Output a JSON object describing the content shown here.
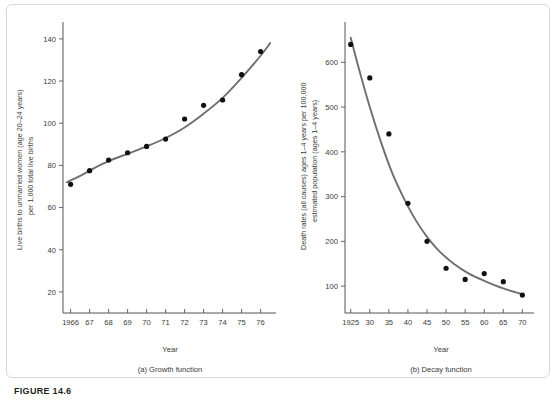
{
  "figure": {
    "number_label": "FIGURE 14.6",
    "border_color": "#d8d8d8",
    "curve_color": "#6f6f6f",
    "point_color": "#111111",
    "axis_color": "#555555"
  },
  "chart_data": [
    {
      "type": "scatter",
      "panel_id": "a",
      "caption": "(a) Growth function",
      "title": "",
      "xlabel": "Year",
      "ylabel": "Live births to unmarried women (age 20–24 years) per 1,000 total live births",
      "ylabel_line1": "Live births to unmarried women (age 20–24 years)",
      "ylabel_line2": "per 1,000 total live births",
      "xtick_labels": [
        "1966",
        "67",
        "68",
        "69",
        "70",
        "71",
        "72",
        "73",
        "74",
        "75",
        "76"
      ],
      "xtick_values": [
        1966,
        1967,
        1968,
        1969,
        1970,
        1971,
        1972,
        1973,
        1974,
        1975,
        1976
      ],
      "ytick_labels": [
        "20",
        "40",
        "60",
        "80",
        "100",
        "120",
        "140"
      ],
      "ytick_values": [
        20,
        40,
        60,
        80,
        100,
        120,
        140
      ],
      "xlim": [
        1965.6,
        1976.6
      ],
      "ylim": [
        10,
        148
      ],
      "grid": false,
      "legend": "none",
      "x": [
        1966,
        1967,
        1968,
        1969,
        1970,
        1971,
        1972,
        1973,
        1974,
        1975,
        1976
      ],
      "values": [
        71,
        77.5,
        82.5,
        86,
        89,
        92.5,
        102,
        108.5,
        111,
        123,
        134
      ],
      "fit_curve": {
        "name": "growth function",
        "x": [
          1965.8,
          1966.5,
          1967.2,
          1968,
          1969,
          1970,
          1971,
          1972,
          1973,
          1974,
          1975,
          1976,
          1976.5
        ],
        "y": [
          72,
          75,
          78.5,
          82,
          85.5,
          89,
          93,
          98,
          104.5,
          112,
          121.5,
          132,
          138
        ]
      }
    },
    {
      "type": "scatter",
      "panel_id": "b",
      "caption": "(b) Decay function",
      "title": "",
      "xlabel": "Year",
      "ylabel": "Death rates (all causes) ages 1–4 years per 100,000 estimated population (ages 1–4 years)",
      "ylabel_line1": "Death rates (all causes) ages 1–4 years per 100,000",
      "ylabel_line2": "estimated population (ages 1–4 years)",
      "xtick_labels": [
        "1925",
        "30",
        "35",
        "40",
        "45",
        "50",
        "55",
        "60",
        "65",
        "70"
      ],
      "xtick_values": [
        1925,
        1930,
        1935,
        1940,
        1945,
        1950,
        1955,
        1960,
        1965,
        1970
      ],
      "ytick_labels": [
        "100",
        "200",
        "300",
        "400",
        "500",
        "600"
      ],
      "ytick_values": [
        100,
        200,
        300,
        400,
        500,
        600
      ],
      "xlim": [
        1923.5,
        1972
      ],
      "ylim": [
        40,
        690
      ],
      "grid": false,
      "legend": "none",
      "x": [
        1925,
        1930,
        1935,
        1940,
        1945,
        1950,
        1955,
        1960,
        1965,
        1970
      ],
      "values": [
        640,
        565,
        440,
        285,
        200,
        140,
        115,
        128,
        110,
        80
      ],
      "fit_curve": {
        "name": "decay function",
        "x": [
          1925,
          1927,
          1930,
          1933,
          1936,
          1939,
          1942,
          1945,
          1948,
          1952,
          1956,
          1960,
          1965,
          1970
        ],
        "y": [
          655,
          590,
          500,
          420,
          350,
          295,
          248,
          210,
          180,
          150,
          128,
          112,
          95,
          82
        ]
      }
    }
  ]
}
